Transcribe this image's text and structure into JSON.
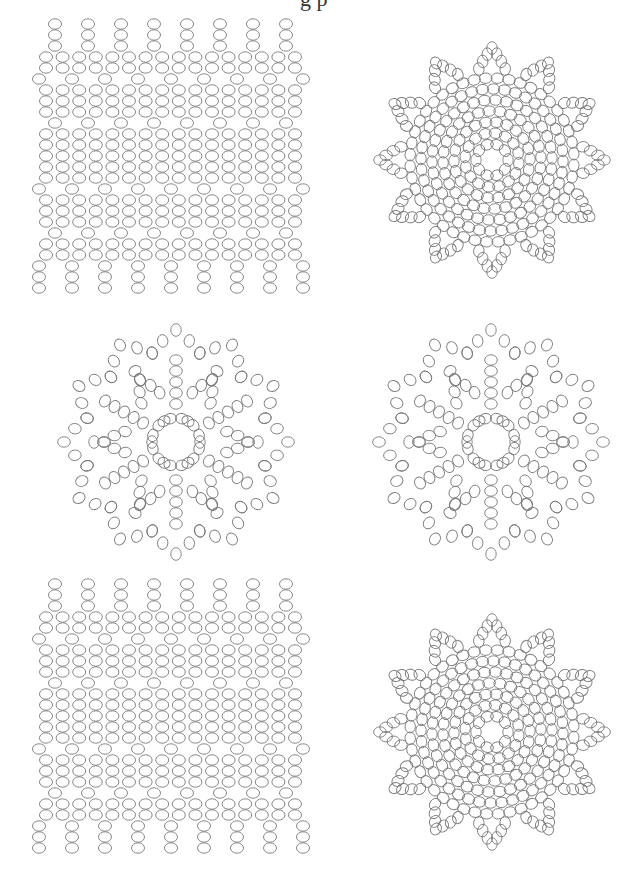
{
  "page": {
    "title_fragment": "g p",
    "bead_stroke_color": "#7a7a7a",
    "background_color": "#ffffff"
  },
  "patterns": [
    {
      "id": "rectangular-netting-top",
      "type": "grid",
      "position": {
        "x": 30,
        "y": 16,
        "w": 285,
        "h": 290
      },
      "bead": {
        "rx": 6.5,
        "ry": 5.2
      },
      "dense_columns": 16,
      "col_spacing": 16.6,
      "first_col_x": 16,
      "row_spacing": 11,
      "top_fringe_cols_x": [
        25,
        58,
        91,
        124,
        157,
        190,
        223,
        256
      ],
      "bottom_fringe_cols_x": [
        9,
        42,
        75,
        108,
        141,
        174,
        207,
        240,
        273
      ],
      "rows": [
        "fringeTop",
        "fringeTop",
        "fringeTop",
        "dense",
        "dense",
        "offsetA",
        "dense",
        "dense",
        "dense",
        "offsetB",
        "dense",
        "dense",
        "dense",
        "dense",
        "dense",
        "offsetA",
        "dense",
        "dense",
        "dense",
        "offsetB",
        "dense",
        "dense",
        "fringeBottom",
        "fringeBottom",
        "fringeBottom"
      ],
      "first_row_y": 8
    },
    {
      "id": "round-doily-dense-top",
      "type": "doily-dense",
      "position": {
        "x": 370,
        "y": 28,
        "w": 245,
        "h": 265
      },
      "center": {
        "x": 122,
        "y": 132
      },
      "bead": {
        "rx": 6.3,
        "ry": 5.2
      },
      "rings": [
        {
          "r": 16,
          "n": 10
        },
        {
          "r": 27,
          "n": 16
        },
        {
          "r": 38,
          "n": 22
        },
        {
          "r": 49,
          "n": 28
        },
        {
          "r": 60,
          "n": 34
        },
        {
          "r": 71,
          "n": 40
        },
        {
          "r": 82,
          "n": 44
        }
      ],
      "points": 12,
      "point_radius": 112
    },
    {
      "id": "snowflake-doily-left",
      "type": "doily-open",
      "position": {
        "x": 55,
        "y": 318,
        "w": 245,
        "h": 250
      },
      "center": {
        "x": 121,
        "y": 124
      },
      "bead": {
        "rx": 6.3,
        "ry": 5.2
      },
      "symmetry": 6,
      "points": 12,
      "outer_radius": 112
    },
    {
      "id": "snowflake-doily-right",
      "type": "doily-open",
      "position": {
        "x": 370,
        "y": 318,
        "w": 245,
        "h": 250
      },
      "center": {
        "x": 121,
        "y": 124
      },
      "bead": {
        "rx": 6.3,
        "ry": 5.2
      },
      "symmetry": 6,
      "points": 12,
      "outer_radius": 112
    },
    {
      "id": "rectangular-netting-bottom",
      "type": "grid",
      "position": {
        "x": 30,
        "y": 576,
        "w": 285,
        "h": 300
      },
      "bead": {
        "rx": 6.5,
        "ry": 5.2
      },
      "dense_columns": 16,
      "col_spacing": 16.6,
      "first_col_x": 16,
      "row_spacing": 11,
      "top_fringe_cols_x": [
        25,
        58,
        91,
        124,
        157,
        190,
        223,
        256
      ],
      "bottom_fringe_cols_x": [
        9,
        42,
        75,
        108,
        141,
        174,
        207,
        240,
        273
      ],
      "rows": [
        "fringeTop",
        "fringeTop",
        "fringeTop",
        "dense",
        "dense",
        "offsetA",
        "dense",
        "dense",
        "dense",
        "offsetB",
        "dense",
        "dense",
        "dense",
        "dense",
        "dense",
        "offsetA",
        "dense",
        "dense",
        "dense",
        "offsetB",
        "dense",
        "dense",
        "fringeBottom",
        "fringeBottom",
        "fringeBottom"
      ],
      "first_row_y": 8
    },
    {
      "id": "round-doily-dense-bottom",
      "type": "doily-dense",
      "position": {
        "x": 370,
        "y": 600,
        "w": 245,
        "h": 270
      },
      "center": {
        "x": 122,
        "y": 132
      },
      "bead": {
        "rx": 6.3,
        "ry": 5.2
      },
      "rings": [
        {
          "r": 16,
          "n": 10
        },
        {
          "r": 27,
          "n": 16
        },
        {
          "r": 38,
          "n": 22
        },
        {
          "r": 49,
          "n": 28
        },
        {
          "r": 60,
          "n": 34
        },
        {
          "r": 71,
          "n": 40
        },
        {
          "r": 82,
          "n": 44
        }
      ],
      "points": 12,
      "point_radius": 112
    }
  ]
}
